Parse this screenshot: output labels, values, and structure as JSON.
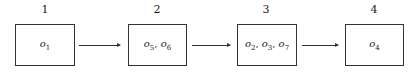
{
  "diagram": {
    "type": "flow",
    "steps": [
      {
        "number": "1",
        "items": [
          {
            "base": "o",
            "sub": "1"
          }
        ]
      },
      {
        "number": "2",
        "items": [
          {
            "base": "o",
            "sub": "5"
          },
          {
            "base": "o",
            "sub": "6"
          }
        ]
      },
      {
        "number": "3",
        "items": [
          {
            "base": "o",
            "sub": "2"
          },
          {
            "base": "o",
            "sub": "3"
          },
          {
            "base": "o",
            "sub": "7"
          }
        ]
      },
      {
        "number": "4",
        "items": [
          {
            "base": "o",
            "sub": "4"
          }
        ]
      }
    ],
    "edges": [
      {
        "from": "1",
        "to": "2"
      },
      {
        "from": "2",
        "to": "3"
      },
      {
        "from": "3",
        "to": "4"
      }
    ],
    "separator": ", "
  }
}
